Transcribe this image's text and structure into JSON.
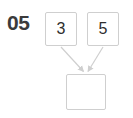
{
  "page": {
    "background_color": "#ffffff",
    "question_number": "05"
  },
  "diagram": {
    "type": "binary-operation-tree",
    "stroke_color": "#cfcfcf",
    "text_color": "#2e2e2e",
    "label_color": "#3b3b3b",
    "operands": [
      {
        "id": "left",
        "value": "3"
      },
      {
        "id": "right",
        "value": "5"
      }
    ],
    "result": {
      "id": "result",
      "value": "",
      "empty": true
    },
    "arrows": [
      {
        "id": "arrow-left-to-result",
        "from": "left",
        "to": "result"
      },
      {
        "id": "arrow-right-to-result",
        "from": "right",
        "to": "result"
      }
    ]
  }
}
